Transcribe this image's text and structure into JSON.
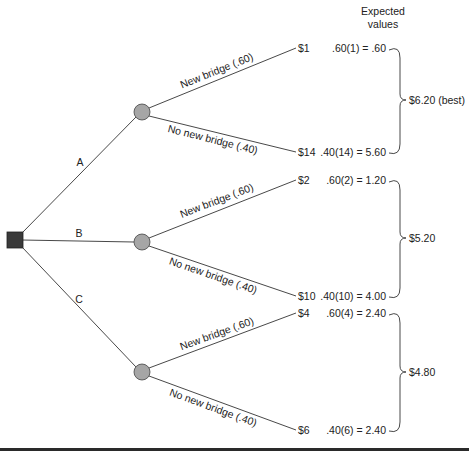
{
  "header": {
    "line1": "Expected",
    "line2": "values"
  },
  "decision_node": {
    "shape": "square",
    "color": "#3a3a3a"
  },
  "chance_node_color": "#a6a6a6",
  "alternatives": [
    {
      "label": "A",
      "outcomes": [
        {
          "event": "New bridge (.60)",
          "payoff": "$1",
          "ev_calc": ".60(1) = .60"
        },
        {
          "event": "No new bridge (.40)",
          "payoff": "$14",
          "ev_calc": ".40(14) = 5.60"
        }
      ],
      "expected_value": "$6.20 (best)"
    },
    {
      "label": "B",
      "outcomes": [
        {
          "event": "New bridge (.60)",
          "payoff": "$2",
          "ev_calc": ".60(2) = 1.20"
        },
        {
          "event": "No new bridge (.40)",
          "payoff": "$10",
          "ev_calc": ".40(10) = 4.00"
        }
      ],
      "expected_value": "$5.20"
    },
    {
      "label": "C",
      "outcomes": [
        {
          "event": "New bridge (.60)",
          "payoff": "$4",
          "ev_calc": ".60(4) = 2.40"
        },
        {
          "event": "No new bridge (.40)",
          "payoff": "$6",
          "ev_calc": ".40(6) = 2.40"
        }
      ],
      "expected_value": "$4.80"
    }
  ]
}
